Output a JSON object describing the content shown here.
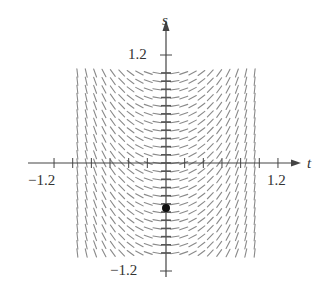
{
  "figure": {
    "type": "slope_field",
    "axes": {
      "horizontal": {
        "name": "t",
        "min_label": "-1.2",
        "max_label": "1.2",
        "min": -1.2,
        "max": 1.2,
        "tick_step": 0.2
      },
      "vertical": {
        "name": "s",
        "min_label": "-1.2",
        "max_label": "1.2",
        "min": -1.2,
        "max": 1.2,
        "tick_step": 0.2
      }
    },
    "labels": {
      "t_axis": "t",
      "s_axis": "s",
      "t_neg": "−1.2",
      "t_pos": "1.2",
      "s_pos": "1.2",
      "s_neg": "−1.2"
    },
    "field": {
      "t_range": [
        -0.95,
        0.95
      ],
      "s_range": [
        -1.0,
        1.0
      ],
      "columns": 21,
      "rows": 23,
      "slope_depends_on": "t only",
      "description": "slopes negative for t<0, zero at t=0, positive for t>0, steepening near t=±1"
    },
    "initial_point": {
      "t": 0,
      "s": -0.5
    },
    "colors": {
      "axis": "#444444",
      "segments": "#8a8a8a",
      "point": "#111111"
    }
  }
}
